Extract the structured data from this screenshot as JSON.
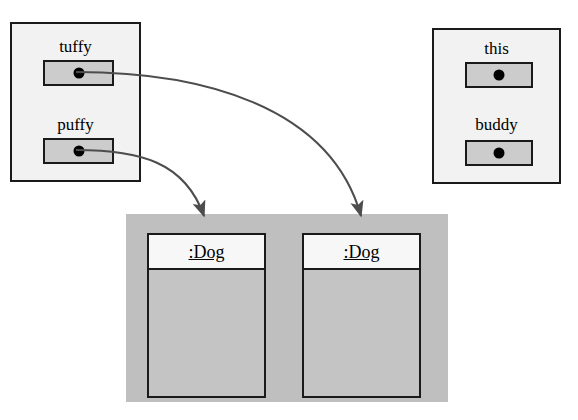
{
  "diagram": {
    "colors": {
      "frame_fill": "#f2f2f2",
      "slot_fill": "#cccccc",
      "heap_fill": "#bfbfbf",
      "object_fill": "#c4c4c4",
      "object_header_fill": "#f7f7f7",
      "stroke": "#1a1a1a",
      "arrow": "#4d4d4d"
    }
  },
  "left_frame": {
    "name": "left-stack-frame",
    "variables": [
      {
        "label": "tuffy",
        "slot_name": "tuffy-reference-slot"
      },
      {
        "label": "puffy",
        "slot_name": "puffy-reference-slot"
      }
    ]
  },
  "right_frame": {
    "name": "right-stack-frame",
    "variables": [
      {
        "label": "this",
        "slot_name": "this-reference-slot"
      },
      {
        "label": "buddy",
        "slot_name": "buddy-reference-slot"
      }
    ]
  },
  "heap": {
    "name": "heap-region",
    "objects": [
      {
        "title": ":Dog"
      },
      {
        "title": ":Dog"
      }
    ]
  },
  "arrows": [
    {
      "name": "tuffy-to-dog-2",
      "from": "tuffy",
      "to": "dog-2"
    },
    {
      "name": "puffy-to-dog-1",
      "from": "puffy",
      "to": "dog-1"
    }
  ]
}
